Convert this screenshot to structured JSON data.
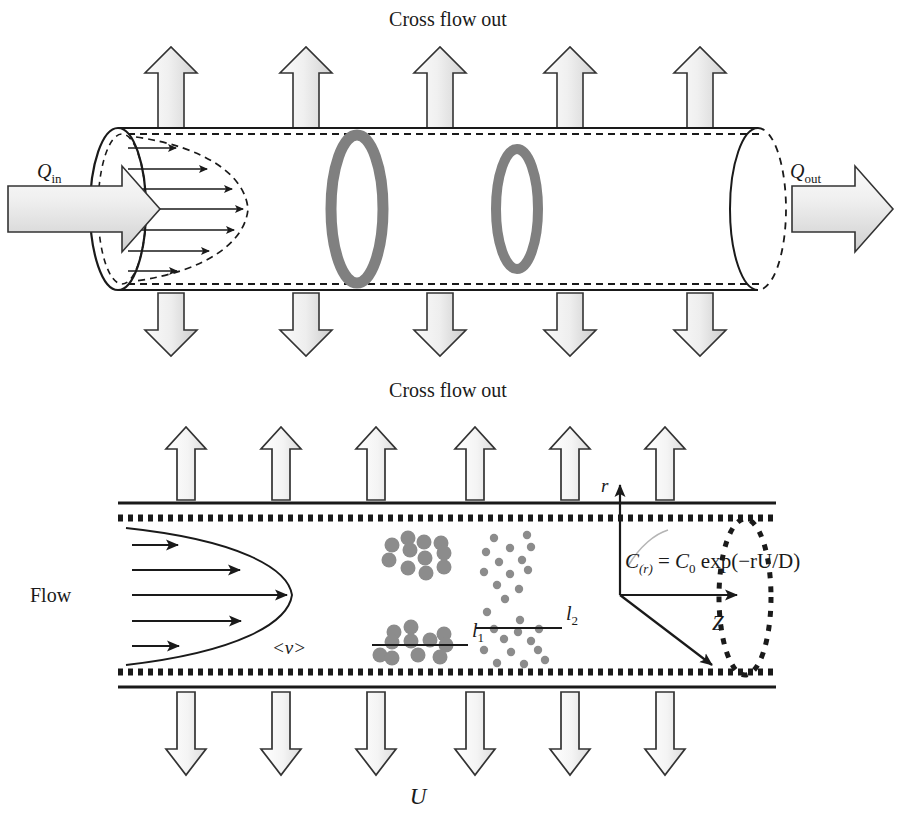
{
  "figure": {
    "colors": {
      "outline": "#1a1a1a",
      "arrow_fill_light": "#f2f2f2",
      "arrow_fill_dark": "#cfcfcf",
      "ring_gray": "#808080",
      "particle_gray": "#8c8c8c",
      "wall": "#1a1a1a",
      "background": "#ffffff"
    }
  },
  "top_panel": {
    "label_top": "Cross flow out",
    "label_bottom": "Cross flow out",
    "inlet_label": {
      "symbol": "Q",
      "subscript": "in"
    },
    "outlet_label": {
      "symbol": "Q",
      "subscript": "out"
    },
    "crossflow_arrows_up": 5,
    "crossflow_arrows_down": 5,
    "velocity_profile_arrows": 7,
    "ring_count": 2,
    "icons": [
      "up-arrow-icon",
      "down-arrow-icon",
      "inlet-flow-arrow-icon",
      "outlet-flow-arrow-icon",
      "ring-icon"
    ]
  },
  "bottom_panel": {
    "flow_label": "Flow",
    "mean_velocity_label": "<v>",
    "axial_velocity_label": "U",
    "radial_axis_label": "r",
    "axial_axis_label": "Z",
    "equation": {
      "lhs_symbol": "C",
      "lhs_subscript": "(r)",
      "equals": " = ",
      "rhs": "C",
      "rhs_subscript": "0",
      "exp_text": " exp(−rU/D)",
      "full": "C(r) = C0 exp(−rU/D)"
    },
    "layer_labels": [
      {
        "name": "l",
        "subscript": "1",
        "particle_size": "large",
        "particle_count": 22
      },
      {
        "name": "l",
        "subscript": "2",
        "particle_size": "small",
        "particle_count": 26
      }
    ],
    "crossflow_arrows_up": 6,
    "crossflow_arrows_down": 6,
    "flow_profile_arrows": 5,
    "icons": [
      "up-arrow-icon",
      "down-arrow-icon",
      "flow-arrow-icon",
      "radial-axis-arrow-icon",
      "axial-axis-arrow-icon",
      "diagonal-arrow-icon",
      "particle-dot-icon"
    ]
  }
}
